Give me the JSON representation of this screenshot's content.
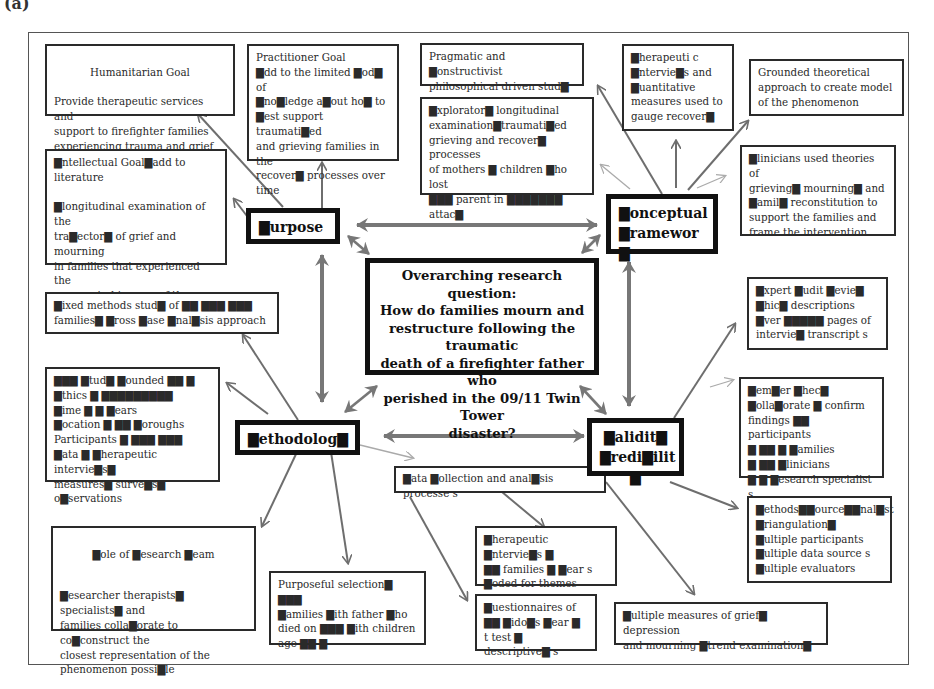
{
  "figure_label": "(a)",
  "center": {
    "question": "Overarching research question:\nHow do families mourn and\nrestructure following the traumatic\ndeath of a firefighter father who\nperished in the 09/11 Twin Tower\ndisaster?"
  },
  "hubs": {
    "purpose": "▇urpose",
    "conceptual": "▇onceptual\n▇ramewor ▇",
    "methodology": "▇ethodolog▇",
    "validity": "▇alidit▇\n▇redi▇ilit  ▇"
  },
  "purpose_boxes": {
    "humanitarian_title": "Humanitarian Goal",
    "humanitarian_body": "Provide therapeutic services and\nsupport to firefighter families\nexperiencing trauma and grief",
    "practitioner": "Practitioner  Goal\n▇dd to the limited ▇od▇ of\n▇no▇ledge a▇out ho▇ to\n▇est support traumati▇ed\nand grieving families in the\nrecover▇  processes  over\ntime",
    "intellectual": "▇ntellectual Goal▇add  to literature\n\n▇longitudinal examination of the\ntra▇ector▇ of grief and mourning\nin  families that experienced the\nunexpected trauma of the  high▇\npu▇lici▇ed terrorist  attac▇ ▇"
  },
  "conceptual_boxes": {
    "pragmatic": "Pragmatic and ▇onstructivist\nphilosophical driven stud▇",
    "exploratory": "▇xplorator▇ longitudinal\nexamination▇traumati▇ed\ngrieving and recover▇ processes\nof mothers ▇ children ▇ho lost\n▇▇▇ parent in  ▇▇▇▇▇▇▇\nattac▇",
    "therapeutic": "▇herapeuti  c\n▇ntervie▇s and\n▇uantitative\nmeasures used to\ngauge recover▇",
    "grounded": "Grounded theoretical\napproach to create model\nof the phenomenon",
    "clinicians": "▇linicians used theories of\ngrieving▇ mourning▇  and\n▇amil▇ reconstitution  to\nsupport  the families and\nframe the intervention"
  },
  "methodology_boxes": {
    "mixed": "▇ixed methods stud▇ of  ▇▇ ▇▇▇ ▇▇▇\nfamilies▇ ▇ross ▇ase ▇nal▇sis approach",
    "details": "   ▇▇▇ ▇tud▇ ▇ounded ▇▇          ▇\n▇thics ▇ ▇▇▇▇▇▇▇▇▇\n▇ime ▇ ▇ ▇ears\n▇ocation ▇ ▇▇ ▇oroughs\nParticipants ▇ ▇▇▇ ▇▇▇\n▇ata ▇ ▇herapeutic intervie▇s▇\nmeasures▇ surve▇s▇ o▇servations",
    "role_title": "▇ole of ▇esearch ▇eam",
    "role_body": "▇esearcher therapists▇ specialists▇  and\nfamilies colla▇orate to co▇construct the\nclosest representation of the\nphenomenon possi▇le",
    "purposeful": "Purposeful selection▇ ▇▇▇\n▇amilies ▇ith father ▇ho\ndied on ▇▇▇ ▇ith children\nage ▇▇    ▇"
  },
  "data_boxes": {
    "collection": "▇ata ▇ollection and anal▇sis processe     s",
    "interviews": "▇herapeutic ▇ntervie▇s    ▇\n ▇▇ families ▇ ▇ear      s\n▇oded for  themes",
    "questionnaires": "▇uestionnaires of\n▇▇ ▇ido▇s ▇ear          ▇\n t test ▇ descriptive▇  s",
    "measures": "▇ultiple measures of grief▇ depression\nand mourning ▇trend examination▇"
  },
  "validity_boxes": {
    "audit": "▇xpert ▇udit ▇evie▇\n▇hic▇ descriptions\n▇ver ▇▇▇▇▇ pages of\nintervie▇ transcript  s",
    "member": "   ▇em▇er ▇hec▇\n▇olla▇orate ▇ confirm\nfindings ▇▇    participants\n▇ ▇▇    ▇ ▇amilies\n▇ ▇▇ ▇linicians\n▇ ▇ ▇esearch specialist     s",
    "triangulation": "▇ethods▇▇ource▇▇nal▇st\n▇riangulation▇\n▇ultiple participants\n▇ultiple data source   s\n▇ultiple evaluators"
  },
  "colors": {
    "arrow": "#6e6e6e",
    "arrow_thick": "#777777",
    "box_border": "#2a2a2a",
    "hub_border": "#111111"
  }
}
